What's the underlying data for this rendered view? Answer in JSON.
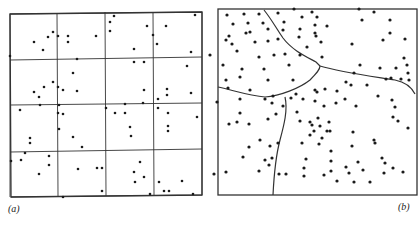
{
  "figure": {
    "panels": [
      {
        "id": "a",
        "label": "(a)",
        "type": "quadrat-grid",
        "description": "Point pattern overlaid with 4x4 square quadrat grid",
        "frame": {
          "x0": 10,
          "y0": 14,
          "x1": 203,
          "y1": 197
        },
        "grid": {
          "verticals": [
            [
              10,
              14,
              10,
              197
            ],
            [
              57,
              13,
              58,
              196
            ],
            [
              105,
              12,
              106,
              196
            ],
            [
              153,
              12,
              154,
              195
            ],
            [
              202,
              12,
              202,
              195
            ]
          ],
          "horizontals": [
            [
              10,
              14,
              202,
              12
            ],
            [
              10,
              60,
              202,
              57
            ],
            [
              10,
              105,
              202,
              103
            ],
            [
              10,
              152,
              202,
              149
            ],
            [
              11,
              197,
              202,
              195
            ]
          ]
        },
        "points": [
          [
            114,
            16
          ],
          [
            195,
            15
          ],
          [
            110,
            22
          ],
          [
            166,
            26
          ],
          [
            147,
            26
          ],
          [
            110,
            31
          ],
          [
            53,
            32
          ],
          [
            48,
            37
          ],
          [
            58,
            36
          ],
          [
            68,
            36
          ],
          [
            96,
            36
          ],
          [
            68,
            42
          ],
          [
            153,
            35
          ],
          [
            157,
            44
          ],
          [
            34,
            42
          ],
          [
            43,
            50
          ],
          [
            134,
            49
          ],
          [
            191,
            52
          ],
          [
            10,
            56
          ],
          [
            77,
            59
          ],
          [
            134,
            62
          ],
          [
            144,
            62
          ],
          [
            187,
            66
          ],
          [
            73,
            73
          ],
          [
            53,
            82
          ],
          [
            58,
            87
          ],
          [
            44,
            87
          ],
          [
            34,
            92
          ],
          [
            63,
            90
          ],
          [
            77,
            91
          ],
          [
            144,
            90
          ],
          [
            167,
            89
          ],
          [
            167,
            95
          ],
          [
            191,
            93
          ],
          [
            39,
            97
          ],
          [
            158,
            99
          ],
          [
            40,
            105
          ],
          [
            59,
            105
          ],
          [
            125,
            104
          ],
          [
            143,
            103
          ],
          [
            20,
            110
          ],
          [
            106,
            108
          ],
          [
            158,
            108
          ],
          [
            58,
            113
          ],
          [
            63,
            114
          ],
          [
            115,
            113
          ],
          [
            125,
            113
          ],
          [
            168,
            113
          ],
          [
            197,
            117
          ],
          [
            59,
            129
          ],
          [
            130,
            127
          ],
          [
            168,
            126
          ],
          [
            168,
            131
          ],
          [
            30,
            138
          ],
          [
            73,
            137
          ],
          [
            30,
            143
          ],
          [
            131,
            136
          ],
          [
            82,
            147
          ],
          [
            25,
            153
          ],
          [
            49,
            156
          ],
          [
            11,
            161
          ],
          [
            21,
            160
          ],
          [
            49,
            165
          ],
          [
            140,
            162
          ],
          [
            39,
            174
          ],
          [
            78,
            169
          ],
          [
            97,
            168
          ],
          [
            102,
            168
          ],
          [
            134,
            172
          ],
          [
            144,
            177
          ],
          [
            135,
            182
          ],
          [
            159,
            182
          ],
          [
            182,
            181
          ],
          [
            164,
            191
          ],
          [
            169,
            191
          ],
          [
            102,
            191
          ],
          [
            150,
            194
          ],
          [
            193,
            194
          ],
          [
            63,
            197
          ]
        ]
      },
      {
        "id": "b",
        "label": "(b)",
        "type": "thiessen-regions",
        "description": "Point pattern partitioned into irregular regions by curved boundaries",
        "frame": {
          "x0": 218,
          "y0": 9,
          "x1": 417,
          "y1": 195
        },
        "boundaries": [
          "M 264 10 C 272 20, 276 28, 283 38 C 292 50, 305 56, 316 62 L 320 66",
          "M 320 66 C 340 72, 370 76, 395 80 C 405 82, 412 88, 415 94",
          "M 218 87 C 232 90, 250 96, 265 97 C 280 96, 300 88, 310 80 C 316 74, 320 70, 320 66",
          "M 285 97 C 288 110, 284 125, 280 140 C 276 155, 274 175, 273 195"
        ],
        "points": [
          [
            227,
            15
          ],
          [
            244,
            14
          ],
          [
            259,
            14
          ],
          [
            278,
            13
          ],
          [
            294,
            9
          ],
          [
            312,
            12
          ],
          [
            359,
            9
          ],
          [
            248,
            23
          ],
          [
            263,
            23
          ],
          [
            284,
            22
          ],
          [
            302,
            17
          ],
          [
            317,
            17
          ],
          [
            233,
            24
          ],
          [
            250,
            32
          ],
          [
            268,
            29
          ],
          [
            283,
            30
          ],
          [
            229,
            36
          ],
          [
            246,
            33
          ],
          [
            300,
            29
          ],
          [
            315,
            33
          ],
          [
            327,
            26
          ],
          [
            315,
            25
          ],
          [
            362,
            20
          ],
          [
            390,
            20
          ],
          [
            374,
            12
          ],
          [
            232,
            44
          ],
          [
            255,
            42
          ],
          [
            268,
            41
          ],
          [
            278,
            39
          ],
          [
            299,
            37
          ],
          [
            316,
            36
          ],
          [
            321,
            42
          ],
          [
            226,
            40
          ],
          [
            237,
            51
          ],
          [
            259,
            57
          ],
          [
            307,
            47
          ],
          [
            352,
            44
          ],
          [
            383,
            40
          ],
          [
            405,
            39
          ],
          [
            300,
            55
          ],
          [
            285,
            54
          ],
          [
            274,
            55
          ],
          [
            210,
            55
          ],
          [
            390,
            33
          ],
          [
            404,
            58
          ],
          [
            223,
            65
          ],
          [
            242,
            69
          ],
          [
            264,
            69
          ],
          [
            289,
            65
          ],
          [
            322,
            57
          ],
          [
            360,
            65
          ],
          [
            354,
            73
          ],
          [
            380,
            68
          ],
          [
            396,
            68
          ],
          [
            407,
            65
          ],
          [
            408,
            73
          ],
          [
            391,
            78
          ],
          [
            409,
            80
          ],
          [
            226,
            80
          ],
          [
            240,
            77
          ],
          [
            268,
            80
          ],
          [
            228,
            88
          ],
          [
            250,
            90
          ],
          [
            293,
            80
          ],
          [
            367,
            85
          ],
          [
            386,
            79
          ],
          [
            401,
            79
          ],
          [
            315,
            90
          ],
          [
            325,
            89
          ],
          [
            337,
            91
          ],
          [
            346,
            82
          ],
          [
            351,
            85
          ],
          [
            217,
            102
          ],
          [
            240,
            99
          ],
          [
            265,
            99
          ],
          [
            272,
            103
          ],
          [
            273,
            96
          ],
          [
            296,
            94
          ],
          [
            291,
            98
          ],
          [
            303,
            99
          ],
          [
            317,
            92
          ],
          [
            336,
            103
          ],
          [
            356,
            106
          ],
          [
            345,
            99
          ],
          [
            378,
            96
          ],
          [
            392,
            100
          ],
          [
            395,
            107
          ],
          [
            240,
            113
          ],
          [
            283,
            106
          ],
          [
            229,
            124
          ],
          [
            237,
            122
          ],
          [
            249,
            124
          ],
          [
            268,
            119
          ],
          [
            324,
            106
          ],
          [
            315,
            101
          ],
          [
            276,
            114
          ],
          [
            297,
            112
          ],
          [
            300,
            121
          ],
          [
            310,
            122
          ],
          [
            318,
            118
          ],
          [
            312,
            125
          ],
          [
            320,
            126
          ],
          [
            327,
            131
          ],
          [
            329,
            122
          ],
          [
            314,
            131
          ],
          [
            310,
            135
          ],
          [
            322,
            138
          ],
          [
            319,
            144
          ],
          [
            408,
            128
          ],
          [
            330,
            131
          ],
          [
            353,
            132
          ],
          [
            374,
            140
          ],
          [
            393,
            117
          ],
          [
            249,
            147
          ],
          [
            260,
            140
          ],
          [
            278,
            143
          ],
          [
            302,
            143
          ],
          [
            331,
            151
          ],
          [
            352,
            146
          ],
          [
            375,
            143
          ],
          [
            382,
            158
          ],
          [
            398,
            121
          ],
          [
            243,
            157
          ],
          [
            270,
            146
          ],
          [
            265,
            160
          ],
          [
            306,
            159
          ],
          [
            331,
            161
          ],
          [
            358,
            162
          ],
          [
            385,
            163
          ],
          [
            214,
            174
          ],
          [
            286,
            174
          ],
          [
            346,
            167
          ],
          [
            384,
            173
          ],
          [
            269,
            165
          ],
          [
            272,
            158
          ],
          [
            304,
            168
          ],
          [
            331,
            171
          ],
          [
            304,
            176
          ],
          [
            363,
            170
          ],
          [
            393,
            168
          ],
          [
            226,
            172
          ],
          [
            259,
            171
          ],
          [
            279,
            174
          ],
          [
            324,
            175
          ],
          [
            337,
            181
          ],
          [
            370,
            182
          ],
          [
            354,
            182
          ],
          [
            403,
            172
          ],
          [
            349,
            173
          ]
        ]
      }
    ],
    "caption_fragment": "",
    "colors": {
      "ink": "#1a1a1a",
      "paper": "#ffffff",
      "line": "#333333"
    }
  }
}
